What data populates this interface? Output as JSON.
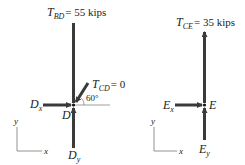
{
  "diagram": {
    "left_fbd": {
      "joint": "D",
      "forces": {
        "t_bd": {
          "sym": "T",
          "sub": "BD",
          "value": "= 55 kips"
        },
        "t_cd": {
          "sym": "T",
          "sub": "CD",
          "value": "= 0"
        },
        "dx": {
          "sym": "D",
          "sub": "x"
        },
        "dy": {
          "sym": "D",
          "sub": "y"
        }
      },
      "angle": "60°",
      "axes": {
        "x": "x",
        "y": "y"
      }
    },
    "right_fbd": {
      "joint": "E",
      "forces": {
        "t_ce": {
          "sym": "T",
          "sub": "CE",
          "value": "= 35 kips"
        },
        "ex": {
          "sym": "E",
          "sub": "x"
        },
        "ey": {
          "sym": "E",
          "sub": "y"
        }
      },
      "axes": {
        "x": "x",
        "y": "y"
      }
    },
    "colors": {
      "member": "#3a3a3a",
      "text": "#222222",
      "thin": "#555555"
    }
  }
}
